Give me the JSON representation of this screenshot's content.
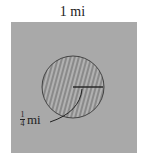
{
  "diagram": {
    "square_label": "1 mi",
    "radius_label": {
      "numerator": "1",
      "denominator": "4",
      "unit": "mi"
    },
    "colors": {
      "square_fill": "#a8a8a8",
      "circle_fill": "#8c8c8c",
      "circle_stroke": "#444444",
      "line": "#222222"
    },
    "shapes": [
      "square",
      "circle",
      "radius-line",
      "leader-line"
    ]
  }
}
